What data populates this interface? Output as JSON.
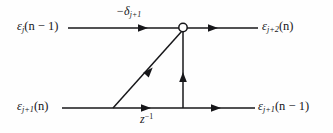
{
  "figure": {
    "kind": "signal-flow-graph",
    "background_color": "#fefefe",
    "line_color": "#17171a",
    "text_color": "#17171a"
  },
  "labels": {
    "input_top": {
      "name": "epsilon-j-n-minus-1",
      "base": "ε",
      "sub": "j",
      "arg": "(n − 1)"
    },
    "coefficient": {
      "name": "minus-delta-j-plus-1",
      "base": "−δ",
      "sub": "j+1",
      "arg": ""
    },
    "output_top": {
      "name": "epsilon-j-plus-2-n",
      "base": "ε",
      "sub": "j+2",
      "arg": "(n)"
    },
    "input_bottom": {
      "name": "epsilon-j-plus-1-n",
      "base": "ε",
      "sub": "j+1",
      "arg": "(n)"
    },
    "delay": {
      "name": "z-inverse",
      "base": "z",
      "sup": "−1"
    },
    "output_bottom": {
      "name": "epsilon-j-plus-1-n-minus-1",
      "base": "ε",
      "sub": "j+1",
      "arg": "(n − 1)"
    }
  },
  "graph": {
    "top_branch": {
      "name": "top-forward-branch",
      "y": 28,
      "x_start": 68,
      "x_end": 258,
      "arrow_positions": [
        145,
        215
      ]
    },
    "bottom_branch": {
      "name": "bottom-forward-branch",
      "y": 108,
      "x_start": 62,
      "x_end": 255,
      "arrow_positions": [
        148,
        218
      ]
    },
    "summing_node": {
      "name": "summing-junction",
      "cx": 183,
      "cy": 27.5,
      "r": 4.2,
      "fill": "#ffffff"
    },
    "diagonal_branch": {
      "name": "cross-coupling-branch",
      "x1": 113,
      "y1": 108,
      "x2": 182,
      "y2": 31,
      "arrow_at": {
        "x": 146,
        "y": 75
      }
    },
    "vertical_branch": {
      "name": "feedback-branch",
      "x": 183,
      "y_start": 108,
      "y_end": 32,
      "arrow_at": {
        "x": 183,
        "y": 72
      }
    }
  }
}
